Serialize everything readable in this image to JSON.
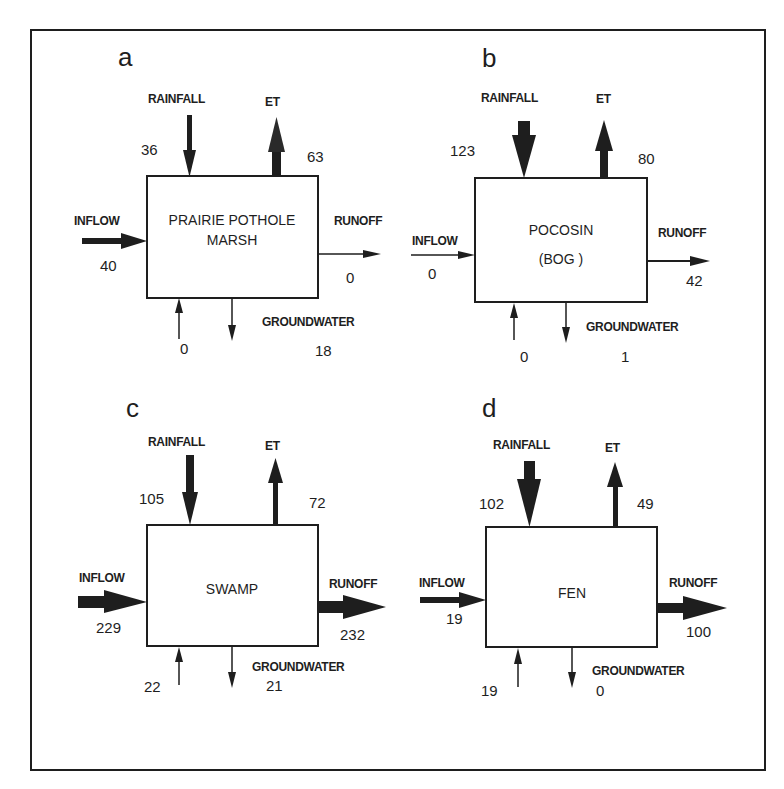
{
  "figure": {
    "frame": {
      "x": 31,
      "y": 30,
      "w": 734,
      "h": 740
    },
    "colors": {
      "ink": "#1e1e1e",
      "background": "#ffffff"
    },
    "panels": [
      {
        "letter": "a",
        "name_lines": [
          "PRAIRIE POTHOLE",
          "MARSH"
        ],
        "box": {
          "x": 147,
          "y": 176,
          "w": 171,
          "h": 122
        },
        "labels": {
          "rainfall": "RAINFALL",
          "et": "ET",
          "inflow": "INFLOW",
          "runoff": "RUNOFF",
          "groundwater": "GROUNDWATER"
        },
        "values": {
          "rainfall": "36",
          "et": "63",
          "inflow": "40",
          "runoff": "0",
          "gw_in": "0",
          "gw_out": "18"
        },
        "widths": {
          "rainfall": 5,
          "et": 7,
          "inflow": 6,
          "runoff": 1.5,
          "gw_in": 1.5,
          "gw_out": 1.5
        }
      },
      {
        "letter": "b",
        "name_lines": [
          "POCOSIN",
          "(BOG )"
        ],
        "box": {
          "x": 475,
          "y": 178,
          "w": 172,
          "h": 124
        },
        "labels": {
          "rainfall": "RAINFALL",
          "et": "ET",
          "inflow": "INFLOW",
          "runoff": "RUNOFF",
          "groundwater": "GROUNDWATER"
        },
        "values": {
          "rainfall": "123",
          "et": "80",
          "inflow": "0",
          "runoff": "42",
          "gw_in": "0",
          "gw_out": "1"
        },
        "widths": {
          "rainfall": 11,
          "et": 7,
          "inflow": 1.5,
          "runoff": 2,
          "gw_in": 1.5,
          "gw_out": 1.5
        }
      },
      {
        "letter": "c",
        "name_lines": [
          "SWAMP"
        ],
        "box": {
          "x": 147,
          "y": 525,
          "w": 171,
          "h": 121
        },
        "labels": {
          "rainfall": "RAINFALL",
          "et": "ET",
          "inflow": "INFLOW",
          "runoff": "RUNOFF",
          "groundwater": "GROUNDWATER"
        },
        "values": {
          "rainfall": "105",
          "et": "72",
          "inflow": "229",
          "runoff": "232",
          "gw_in": "22",
          "gw_out": "21"
        },
        "widths": {
          "rainfall": 7,
          "et": 5,
          "inflow": 11,
          "runoff": 11,
          "gw_in": 1.5,
          "gw_out": 1.5
        }
      },
      {
        "letter": "d",
        "name_lines": [
          "FEN"
        ],
        "box": {
          "x": 486,
          "y": 527,
          "w": 171,
          "h": 120
        },
        "labels": {
          "rainfall": "RAINFALL",
          "et": "ET",
          "inflow": "INFLOW",
          "runoff": "RUNOFF",
          "groundwater": "GROUNDWATER"
        },
        "values": {
          "rainfall": "102",
          "et": "49",
          "inflow": "19",
          "runoff": "100",
          "gw_in": "19",
          "gw_out": "0"
        },
        "widths": {
          "rainfall": 10,
          "et": 5,
          "inflow": 5,
          "runoff": 10,
          "gw_in": 1.5,
          "gw_out": 1.5
        }
      }
    ]
  }
}
